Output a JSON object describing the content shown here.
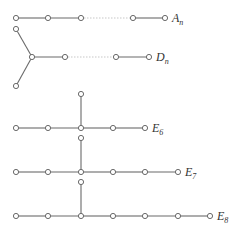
{
  "diagrams": [
    {
      "id": "An",
      "label": "A",
      "subscript": "n",
      "label_pos": [
        172,
        22
      ],
      "nodes": [
        [
          16,
          18
        ],
        [
          48,
          18
        ],
        [
          81,
          18
        ],
        [
          133,
          18
        ],
        [
          165,
          18
        ]
      ],
      "edges": [
        [
          0,
          1
        ],
        [
          1,
          2
        ],
        [
          3,
          4
        ]
      ],
      "gap_edges": [
        [
          2,
          3
        ]
      ]
    },
    {
      "id": "Dn",
      "label": "D",
      "subscript": "n",
      "label_pos": [
        156,
        61
      ],
      "nodes": [
        [
          16,
          29
        ],
        [
          16,
          86
        ],
        [
          32,
          57
        ],
        [
          65,
          57
        ],
        [
          116,
          57
        ],
        [
          149,
          57
        ]
      ],
      "edges": [
        [
          0,
          2
        ],
        [
          1,
          2
        ],
        [
          2,
          3
        ],
        [
          4,
          5
        ]
      ],
      "gap_edges": [
        [
          3,
          4
        ]
      ]
    },
    {
      "id": "E6",
      "label": "E",
      "subscript": "6",
      "label_pos": [
        152,
        132
      ],
      "nodes": [
        [
          16,
          128
        ],
        [
          48,
          128
        ],
        [
          81,
          128
        ],
        [
          113,
          128
        ],
        [
          145,
          128
        ],
        [
          81,
          94
        ]
      ],
      "edges": [
        [
          0,
          1
        ],
        [
          1,
          2
        ],
        [
          2,
          3
        ],
        [
          3,
          4
        ],
        [
          2,
          5
        ]
      ],
      "gap_edges": []
    },
    {
      "id": "E7",
      "label": "E",
      "subscript": "7",
      "label_pos": [
        185,
        176
      ],
      "nodes": [
        [
          16,
          172
        ],
        [
          48,
          172
        ],
        [
          81,
          172
        ],
        [
          113,
          172
        ],
        [
          145,
          172
        ],
        [
          178,
          172
        ],
        [
          81,
          138
        ]
      ],
      "edges": [
        [
          0,
          1
        ],
        [
          1,
          2
        ],
        [
          2,
          3
        ],
        [
          3,
          4
        ],
        [
          4,
          5
        ],
        [
          2,
          6
        ]
      ],
      "gap_edges": []
    },
    {
      "id": "E8",
      "label": "E",
      "subscript": "8",
      "label_pos": [
        217,
        220
      ],
      "nodes": [
        [
          16,
          216
        ],
        [
          48,
          216
        ],
        [
          81,
          216
        ],
        [
          113,
          216
        ],
        [
          145,
          216
        ],
        [
          178,
          216
        ],
        [
          210,
          216
        ],
        [
          81,
          182
        ]
      ],
      "edges": [
        [
          0,
          1
        ],
        [
          1,
          2
        ],
        [
          2,
          3
        ],
        [
          3,
          4
        ],
        [
          4,
          5
        ],
        [
          5,
          6
        ],
        [
          2,
          7
        ]
      ],
      "gap_edges": []
    }
  ],
  "style": {
    "edge_color": "#6a6a6a",
    "node_fill": "#ffffff",
    "label_color": "#333333",
    "node_radius": 2.6
  }
}
